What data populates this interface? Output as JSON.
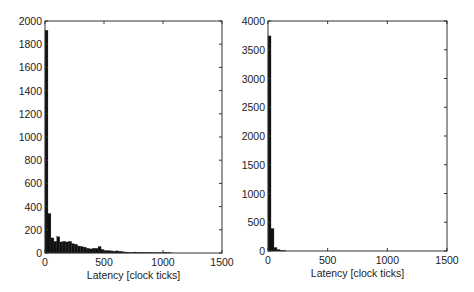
{
  "chart_data": [
    {
      "type": "bar",
      "title": "",
      "xlabel": "Latency [clock ticks]",
      "ylabel": "",
      "xlim": [
        0,
        1500
      ],
      "ylim": [
        0,
        2000
      ],
      "xticks": [
        0,
        500,
        1000,
        1500
      ],
      "yticks": [
        0,
        200,
        400,
        600,
        800,
        1000,
        1200,
        1400,
        1600,
        1800,
        2000
      ],
      "grid": false,
      "bin_width": 25,
      "x": [
        0,
        25,
        50,
        75,
        100,
        125,
        150,
        175,
        200,
        225,
        250,
        275,
        300,
        325,
        350,
        375,
        400,
        425,
        450,
        475,
        500,
        525,
        550,
        575,
        600,
        625,
        650,
        675,
        700,
        725,
        750,
        775,
        800,
        825,
        850,
        875,
        900,
        925,
        950,
        975,
        1000,
        1025,
        1050
      ],
      "values": [
        1920,
        340,
        130,
        100,
        140,
        95,
        100,
        95,
        100,
        80,
        75,
        60,
        55,
        50,
        40,
        35,
        40,
        40,
        55,
        30,
        20,
        20,
        18,
        15,
        18,
        15,
        10,
        8,
        6,
        5,
        8,
        5,
        6,
        5,
        5,
        3,
        3,
        3,
        2,
        2,
        5,
        3,
        2
      ]
    },
    {
      "type": "bar",
      "title": "",
      "xlabel": "Latency [clock ticks]",
      "ylabel": "",
      "xlim": [
        0,
        1500
      ],
      "ylim": [
        0,
        4000
      ],
      "xticks": [
        0,
        500,
        1000,
        1500
      ],
      "yticks": [
        0,
        500,
        1000,
        1500,
        2000,
        2500,
        3000,
        3500,
        4000
      ],
      "grid": false,
      "bin_width": 25,
      "x": [
        0,
        25,
        50,
        75,
        100,
        125
      ],
      "values": [
        3740,
        390,
        60,
        25,
        10,
        5
      ]
    }
  ],
  "panels": {
    "left": {
      "xlabel": "Latency [clock ticks]"
    },
    "right": {
      "xlabel": "Latency [clock ticks]"
    }
  }
}
